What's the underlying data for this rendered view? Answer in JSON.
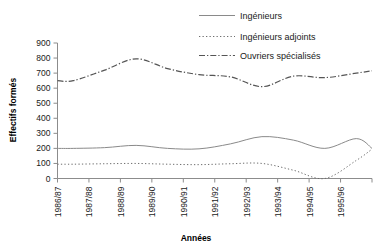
{
  "chart_data": {
    "type": "line",
    "title": "",
    "xlabel": "Années",
    "ylabel": "Effectifs formés",
    "categories": [
      "1986/87",
      "1987/88",
      "1988/89",
      "1989/90",
      "1990/91",
      "1991/92",
      "1992/93",
      "1993/94",
      "1994/95",
      "1995/96"
    ],
    "ylim": [
      0,
      900
    ],
    "yticks": [
      0,
      100,
      200,
      300,
      400,
      500,
      600,
      700,
      800,
      900
    ],
    "grid": false,
    "legend_position": "top-right",
    "series": [
      {
        "name": "Ingénieurs",
        "style": "solid",
        "color": "#8a8a8a",
        "values": [
          200,
          205,
          220,
          200,
          197,
          230,
          278,
          255,
          200,
          265
        ]
      },
      {
        "name": "Ingénieurs adjoints",
        "style": "dotted",
        "color": "#6e6e6e",
        "values": [
          95,
          98,
          100,
          95,
          92,
          98,
          100,
          55,
          0,
          120
        ]
      },
      {
        "name": "Ouvriers spécialisés",
        "style": "dashdot",
        "color": "#555555",
        "values": [
          650,
          720,
          795,
          730,
          690,
          675,
          610,
          680,
          670,
          700
        ]
      }
    ],
    "series_endpoints": {
      "Ingénieurs": 200,
      "Ingénieurs adjoints": 195,
      "Ouvriers spécialisés": 715
    }
  },
  "legend": {
    "items": [
      {
        "label": "Ingénieurs",
        "swatch": "solid-line-swatch"
      },
      {
        "label": "Ingénieurs adjoints",
        "swatch": "dotted-line-swatch"
      },
      {
        "label": "Ouvriers spécialisés",
        "swatch": "dashdot-line-swatch"
      }
    ]
  },
  "axes": {
    "y_title": "Effectifs formés",
    "x_title": "Années",
    "y_tick_labels": [
      "900",
      "800",
      "700",
      "600",
      "500",
      "400",
      "300",
      "200",
      "100",
      "0"
    ],
    "x_tick_labels": [
      "1986/87",
      "1987/88",
      "1988/89",
      "1989/90",
      "1990/91",
      "1991/92",
      "1992/93",
      "1993/94",
      "1994/95",
      "1995/96"
    ]
  }
}
